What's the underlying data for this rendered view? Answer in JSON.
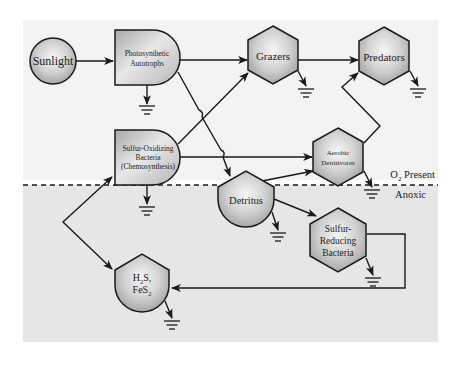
{
  "diagram": {
    "type": "energy-flow",
    "colors": {
      "upper_zone": "#f3f3f3",
      "lower_zone": "#e6e6e6",
      "node_fill_light": "#f4f4f4",
      "node_fill_dark": "#a8a8a8",
      "stroke": "#1a1a1a"
    },
    "boundary": {
      "upper_label": "O₂ Present",
      "lower_label": "Anoxic"
    },
    "nodes": {
      "sunlight": {
        "label": "Sunlight",
        "shape": "circle"
      },
      "photo": {
        "line1": "Photosynthetic",
        "line2": "Autotrophs",
        "shape": "storage-tank"
      },
      "grazers": {
        "label": "Grazers",
        "shape": "hexagon"
      },
      "predators": {
        "label": "Predators",
        "shape": "hexagon"
      },
      "sulfox": {
        "line1": "Sulfur-Oxidizing",
        "line2": "Bacteria",
        "line3": "(Chemosynthesis)",
        "shape": "storage-tank"
      },
      "aerobic": {
        "line1": "Aerobic",
        "line2": "Detritivores",
        "shape": "hexagon"
      },
      "detritus": {
        "label": "Detritus",
        "shape": "storage-bin"
      },
      "sulfred": {
        "line1": "Sulfur-",
        "line2": "Reducing",
        "line3": "Bacteria",
        "shape": "hexagon"
      },
      "h2s": {
        "line1a": "H",
        "line1sub": "2",
        "line1b": "S,",
        "line2a": "FeS",
        "line2sub": "2",
        "shape": "storage-bin"
      }
    },
    "edges": [
      {
        "from": "Sunlight",
        "to": "Photosynthetic Autotrophs"
      },
      {
        "from": "Photosynthetic Autotrophs",
        "to": "Grazers"
      },
      {
        "from": "Photosynthetic Autotrophs",
        "to": "Detritus"
      },
      {
        "from": "Grazers",
        "to": "Predators"
      },
      {
        "from": "Sulfur-Oxidizing Bacteria",
        "to": "Grazers"
      },
      {
        "from": "Sulfur-Oxidizing Bacteria",
        "to": "Aerobic Detritivores"
      },
      {
        "from": "Sulfur-Oxidizing Bacteria",
        "to": "H2S, FeS2"
      },
      {
        "from": "H2S, FeS2",
        "to": "Sulfur-Oxidizing Bacteria"
      },
      {
        "from": "Detritus",
        "to": "Aerobic Detritivores"
      },
      {
        "from": "Detritus",
        "to": "Sulfur-Reducing Bacteria"
      },
      {
        "from": "Aerobic Detritivores",
        "to": "Predators"
      },
      {
        "from": "Sulfur-Reducing Bacteria",
        "to": "H2S, FeS2"
      }
    ],
    "heat_sinks": [
      "Photosynthetic Autotrophs",
      "Grazers",
      "Predators",
      "Sulfur-Oxidizing Bacteria",
      "Aerobic Detritivores",
      "Detritus",
      "Sulfur-Reducing Bacteria",
      "H2S, FeS2"
    ]
  }
}
